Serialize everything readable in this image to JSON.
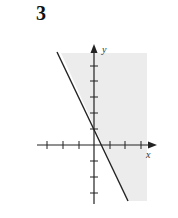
{
  "figure": {
    "label": "3",
    "x_axis_label": "x",
    "y_axis_label": "y",
    "colors": {
      "shading": "#ececec",
      "axis": "#222222",
      "line": "#222222",
      "background": "#ffffff"
    }
  },
  "graph": {
    "type": "linear-inequality-region",
    "boundary_line": {
      "slope": -2,
      "y_intercept": 1,
      "style": "solid"
    },
    "shaded_side": "right/above the line (y >= -2x + 1)",
    "x_ticks": [
      -3,
      -2,
      -1,
      1,
      2,
      3
    ],
    "y_ticks": [
      -3,
      -2,
      -1,
      1,
      2,
      3,
      4,
      5
    ]
  }
}
